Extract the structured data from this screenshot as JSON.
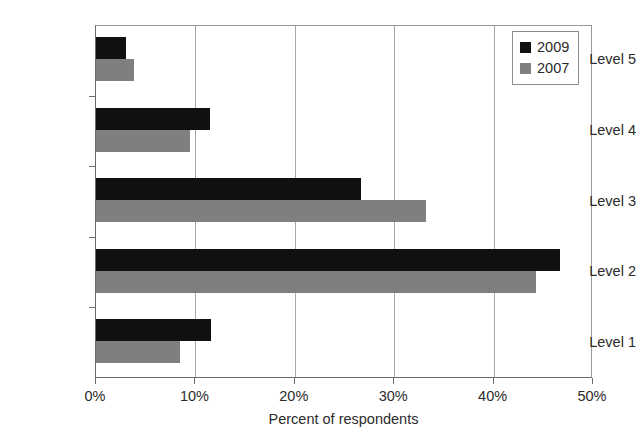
{
  "chart_data": {
    "type": "bar",
    "orientation": "horizontal",
    "title": "",
    "xlabel": "Percent of respondents",
    "ylabel": "",
    "xlim": [
      0,
      50
    ],
    "xticks": [
      0,
      10,
      20,
      30,
      40,
      50
    ],
    "xtick_labels": [
      "0%",
      "10%",
      "20%",
      "30%",
      "40%",
      "50%"
    ],
    "categories": [
      "Level 1",
      "Level 2",
      "Level 3",
      "Level 4",
      "Level 5"
    ],
    "category_order_top_to_bottom": [
      "Level 5",
      "Level 4",
      "Level 3",
      "Level 2",
      "Level 1"
    ],
    "grid": "vertical",
    "legend_position": "top-right",
    "series": [
      {
        "name": "2009",
        "color": "#101010",
        "values": [
          11.6,
          46.7,
          26.7,
          11.5,
          3.0
        ]
      },
      {
        "name": "2007",
        "color": "#7f7f7f",
        "values": [
          8.5,
          44.3,
          33.2,
          9.5,
          3.8
        ]
      }
    ]
  },
  "legend": {
    "entries": [
      {
        "label": "2009",
        "swatch": "black-square-swatch"
      },
      {
        "label": "2007",
        "swatch": "gray-square-swatch"
      }
    ]
  },
  "axis": {
    "x_title": "Percent of respondents"
  }
}
